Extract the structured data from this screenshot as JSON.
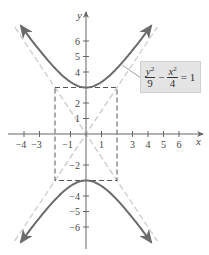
{
  "chart_data": {
    "type": "line",
    "title": "",
    "xlabel": "x",
    "ylabel": "y",
    "xlim": [
      -4.9,
      7.5
    ],
    "ylim": [
      -7.3,
      7.8
    ],
    "grid": false,
    "x_ticks": [
      -4,
      -3,
      -1,
      1,
      3,
      4,
      5,
      6
    ],
    "y_ticks": [
      -6,
      -5,
      -4,
      -2,
      1,
      2,
      4,
      5,
      6
    ],
    "x_tick_labels": [
      "−4",
      "−3",
      "−1",
      "1",
      "3",
      "4",
      "5",
      "6"
    ],
    "y_tick_labels": [
      "−6",
      "−5",
      "−4",
      "−2",
      "1",
      "2",
      "4",
      "5",
      "6"
    ],
    "series": [
      {
        "name": "hyperbola upper branch",
        "equation": "y = 3*sqrt(1 + x^2/4)",
        "style": "solid",
        "color": "#6b6b6b",
        "x": [
          -4.2,
          -3,
          -2,
          -1,
          0,
          1,
          2,
          3,
          4.2
        ],
        "y": [
          6.98,
          5.41,
          4.24,
          3.35,
          3,
          3.35,
          4.24,
          5.41,
          6.98
        ]
      },
      {
        "name": "hyperbola lower branch",
        "equation": "y = -3*sqrt(1 + x^2/4)",
        "style": "solid",
        "color": "#6b6b6b",
        "x": [
          -4.2,
          -3,
          -2,
          -1,
          0,
          1,
          2,
          3,
          4.2
        ],
        "y": [
          -6.98,
          -5.41,
          -4.24,
          -3.35,
          -3,
          -3.35,
          -4.24,
          -5.41,
          -6.98
        ]
      },
      {
        "name": "asymptote y = 1.5x",
        "style": "dashed",
        "color": "#c8c8c8",
        "x": [
          -4.6,
          4.6
        ],
        "y": [
          -6.9,
          6.9
        ]
      },
      {
        "name": "asymptote y = -1.5x",
        "style": "dashed",
        "color": "#c8c8c8",
        "x": [
          -4.6,
          4.6
        ],
        "y": [
          6.9,
          -6.9
        ]
      },
      {
        "name": "fundamental rectangle",
        "style": "dashed",
        "color": "#555555",
        "x": [
          -2,
          2,
          2,
          -2,
          -2
        ],
        "y": [
          3,
          3,
          -3,
          -3,
          3
        ]
      }
    ],
    "annotations": [
      {
        "text": "y²/9 − x²/4 = 1",
        "points_to": "upper branch, right side"
      }
    ]
  },
  "labels": {
    "x_axis": "x",
    "y_axis": "y",
    "equation": {
      "num1": "y",
      "exp1": "2",
      "den1": "9",
      "minus": "−",
      "num2": "x",
      "exp2": "2",
      "den2": "4",
      "equals": "= 1"
    }
  }
}
